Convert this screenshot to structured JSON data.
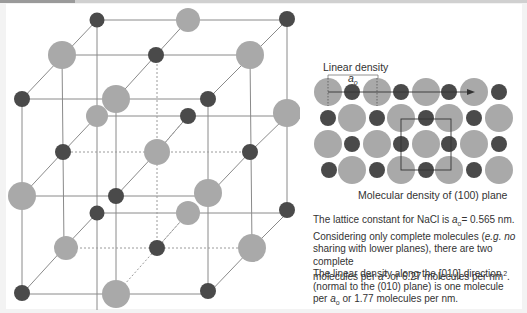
{
  "figure": {
    "left": {
      "title": "NaCl rock-salt unit cell",
      "atom_colors": {
        "large": "#a9a9a9",
        "small": "#4a4a4a",
        "lines": "#8a8a8a"
      }
    },
    "right": {
      "linear_density_label": "Linear density",
      "a0_label": "a",
      "a0_sub": "o",
      "caption": "Molecular density of (100) plane"
    }
  },
  "text": {
    "p1_a": "The lattice constant for NaCl is ",
    "p1_var": "a",
    "p1_sub": "o",
    "p1_b": "= 0.565 nm.",
    "p1_c": "Considering only complete molecules (",
    "p1_ital": "e.g.",
    "p1_d": " no",
    "p1_e": "sharing with lower planes), there are two complete",
    "p1_f": "molecules per ",
    "p1_var2": "a",
    "p1_sup": "2",
    "p1_g": " or 6.27 molecules per nm",
    "p1_sup2": "2",
    "p1_h": ".",
    "p2_a": "The linear density along the [010] direction",
    "p2_b": "(normal to the (010) plane) is one molecule",
    "p2_c": "per ",
    "p2_var": "a",
    "p2_sub": "o",
    "p2_d": " or 1.77 molecules per nm."
  }
}
